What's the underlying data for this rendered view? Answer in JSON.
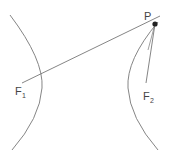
{
  "diagram": {
    "type": "hyperbola-foci",
    "colors": {
      "stroke": "#777777",
      "point": "#222222",
      "text": "#444444"
    },
    "labels": {
      "point": "P",
      "focus1_main": "F",
      "focus1_sub": "1",
      "focus2_main": "F",
      "focus2_sub": "2"
    }
  }
}
